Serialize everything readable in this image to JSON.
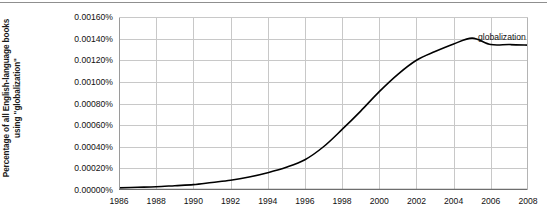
{
  "chart_data": {
    "type": "line",
    "title": "",
    "subtitle": "",
    "xlabel": "",
    "ylabel": "Percentage of all English-language books using \"globalization\"",
    "ylabel_line1": "Percentage of all English-language books",
    "ylabel_line2": "using \"globalization\"",
    "xlim": [
      1986,
      2008
    ],
    "ylim": [
      0.0,
      0.0016
    ],
    "grid": true,
    "grid_color": "#c8c8c8",
    "legend_position": "inline-right-annotation",
    "line_color": "#000000",
    "line_width": 1.6,
    "xticks": [
      1986,
      1988,
      1990,
      1992,
      1994,
      1996,
      1998,
      2000,
      2002,
      2004,
      2006,
      2008
    ],
    "xtick_labels": [
      "1986",
      "1988",
      "1990",
      "1992",
      "1994",
      "1996",
      "1998",
      "2000",
      "2002",
      "2004",
      "2006",
      "2008"
    ],
    "yticks": [
      0.0,
      0.0002,
      0.0004,
      0.0006,
      0.0008,
      0.001,
      0.0012,
      0.0014,
      0.0016
    ],
    "ytick_labels": [
      "0.00000%",
      "0.00020%",
      "0.00040%",
      "0.00060%",
      "0.00080%",
      "0.00100%",
      "0.00120%",
      "0.00140%",
      "0.00160%"
    ],
    "series": [
      {
        "name": "globalization",
        "annotation": "globalization",
        "x": [
          1986,
          1987,
          1988,
          1989,
          1990,
          1991,
          1992,
          1993,
          1994,
          1995,
          1996,
          1997,
          1998,
          1999,
          2000,
          2001,
          2002,
          2003,
          2004,
          2005,
          2006,
          2007,
          2008
        ],
        "values": [
          2e-05,
          2.5e-05,
          3e-05,
          4e-05,
          5e-05,
          7e-05,
          9e-05,
          0.00012,
          0.00016,
          0.00021,
          0.00028,
          0.0004,
          0.00056,
          0.00073,
          0.00091,
          0.00107,
          0.0012,
          0.00128,
          0.00135,
          0.001405,
          0.001345,
          0.001345,
          0.00134
        ]
      }
    ]
  }
}
